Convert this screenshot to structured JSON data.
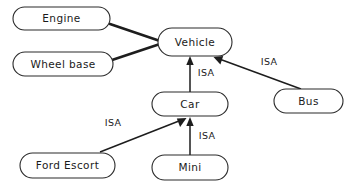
{
  "diagram": {
    "colors": {
      "background": "#ffffff",
      "node_fill": "#ffffff",
      "node_stroke": "#2b2b2b",
      "link_stroke": "#1d1d1d",
      "text": "#1a1a1a"
    },
    "nodes": [
      {
        "id": "engine",
        "label": "Engine",
        "cx": 61.5,
        "cy": 18.5,
        "w": 97,
        "h": 23
      },
      {
        "id": "wheel_base",
        "label": "Wheel base",
        "cx": 63.0,
        "cy": 64.0,
        "w": 100,
        "h": 24
      },
      {
        "id": "vehicle",
        "label": "Vehicle",
        "cx": 195.0,
        "cy": 42.0,
        "w": 74,
        "h": 28
      },
      {
        "id": "bus",
        "label": "Bus",
        "cx": 308.5,
        "cy": 101.0,
        "w": 69,
        "h": 24
      },
      {
        "id": "car",
        "label": "Car",
        "cx": 190.0,
        "cy": 104.0,
        "w": 76,
        "h": 24
      },
      {
        "id": "ford_escort",
        "label": "Ford Escort",
        "cx": 67.5,
        "cy": 165.5,
        "w": 95,
        "h": 25
      },
      {
        "id": "mini",
        "label": "Mini",
        "cx": 190.0,
        "cy": 167.5,
        "w": 76,
        "h": 25
      }
    ],
    "links": [
      {
        "id": "engine-vehicle",
        "kind": "attribute",
        "from": "engine",
        "to": "vehicle",
        "label": "",
        "x1": 110,
        "y1": 24,
        "x2": 160,
        "y2": 41,
        "arrow": false
      },
      {
        "id": "wheelbase-vehicle",
        "kind": "attribute",
        "from": "wheel_base",
        "to": "vehicle",
        "label": "",
        "x1": 112,
        "y1": 60,
        "x2": 160,
        "y2": 44,
        "arrow": false
      },
      {
        "id": "car-isa-vehicle",
        "kind": "isa",
        "from": "car",
        "to": "vehicle",
        "label": "ISA",
        "label_x": 206,
        "label_y": 73,
        "x1": 190,
        "y1": 92,
        "x2": 190,
        "y2": 57,
        "arrow": true
      },
      {
        "id": "bus-isa-vehicle",
        "kind": "isa",
        "from": "bus",
        "to": "vehicle",
        "label": "ISA",
        "label_x": 269,
        "label_y": 62,
        "x1": 301,
        "y1": 89,
        "x2": 215,
        "y2": 57,
        "arrow": true
      },
      {
        "id": "mini-isa-car",
        "kind": "isa",
        "from": "mini",
        "to": "car",
        "label": "ISA",
        "label_x": 207,
        "label_y": 136,
        "x1": 190,
        "y1": 155,
        "x2": 190,
        "y2": 118,
        "arrow": true
      },
      {
        "id": "fordescort-isa-car",
        "kind": "isa",
        "from": "ford_escort",
        "to": "car",
        "label": "ISA",
        "label_x": 113,
        "label_y": 123,
        "x1": 100,
        "y1": 152,
        "x2": 186,
        "y2": 118,
        "arrow": true
      }
    ]
  }
}
